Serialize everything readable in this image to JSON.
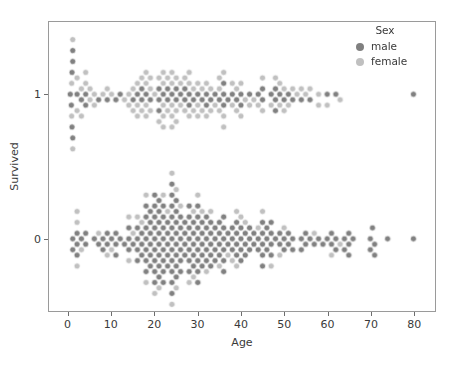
{
  "chart_data": {
    "type": "scatter",
    "plot_style": "swarmplot",
    "title": "",
    "xlabel": "Age",
    "ylabel": "Survived",
    "xlim": [
      -4.5,
      85
    ],
    "ylim": [
      -0.5,
      1.5
    ],
    "grid": false,
    "xticks": [
      0,
      10,
      20,
      30,
      40,
      50,
      60,
      70,
      80
    ],
    "xticklabels": [
      "0",
      "10",
      "20",
      "30",
      "40",
      "50",
      "60",
      "70",
      "80"
    ],
    "yticks": [
      0,
      1
    ],
    "yticklabels": [
      "0",
      "1"
    ],
    "legend": {
      "title": "Sex",
      "position": "upper right",
      "entries": [
        {
          "label": "male",
          "color": "#808080"
        },
        {
          "label": "female",
          "color": "#c0c0c0"
        }
      ]
    },
    "categories": [
      "0",
      "1"
    ],
    "series": [
      {
        "name": "male",
        "color": "#808080",
        "marker": "o",
        "points_survived_0": [
          1,
          1,
          2,
          2,
          2,
          3,
          4,
          4,
          6,
          7,
          8,
          8,
          9,
          9,
          10,
          11,
          11,
          11,
          12,
          13,
          14,
          14,
          14,
          15,
          16,
          16,
          16,
          16,
          17,
          17,
          17,
          18,
          18,
          18,
          18,
          18,
          18,
          18,
          19,
          19,
          19,
          19,
          19,
          19,
          20,
          20,
          20,
          20,
          20,
          20,
          20,
          20,
          20,
          21,
          21,
          21,
          21,
          21,
          21,
          21,
          21,
          22,
          22,
          22,
          22,
          22,
          22,
          22,
          22,
          23,
          23,
          23,
          23,
          23,
          24,
          24,
          24,
          24,
          24,
          24,
          24,
          24,
          24,
          24,
          24,
          25,
          25,
          25,
          25,
          25,
          25,
          25,
          25,
          26,
          26,
          26,
          26,
          26,
          26,
          27,
          27,
          27,
          27,
          28,
          28,
          28,
          28,
          28,
          28,
          28,
          29,
          29,
          29,
          29,
          29,
          30,
          30,
          30,
          30,
          30,
          30,
          30,
          30,
          31,
          31,
          31,
          31,
          31,
          32,
          32,
          32,
          32,
          32,
          33,
          33,
          33,
          33,
          33,
          34,
          34,
          34,
          34,
          35,
          35,
          35,
          35,
          36,
          36,
          36,
          36,
          36,
          36,
          37,
          37,
          38,
          38,
          38,
          39,
          39,
          39,
          39,
          40,
          40,
          40,
          40,
          41,
          41,
          41,
          42,
          42,
          42,
          43,
          43,
          44,
          44,
          45,
          45,
          45,
          45,
          45,
          46,
          46,
          46,
          47,
          47,
          47,
          47,
          48,
          49,
          49,
          50,
          50,
          51,
          51,
          52,
          52,
          54,
          54,
          55,
          55,
          56,
          57,
          58,
          59,
          60,
          61,
          61,
          62,
          62,
          64,
          64,
          65,
          65,
          65,
          66,
          70,
          70,
          70.5,
          71,
          71,
          74,
          80
        ],
        "points_survived_1": [
          0.42,
          0.67,
          0.83,
          0.83,
          1,
          1,
          1,
          2,
          3,
          4,
          4,
          7,
          9,
          11,
          12,
          15,
          16,
          17,
          17,
          18,
          19,
          21,
          21,
          21,
          22,
          23,
          23,
          24,
          25,
          25,
          26,
          27,
          27,
          28,
          28,
          29,
          30,
          31,
          32,
          32,
          33,
          34,
          35,
          36,
          36,
          36,
          37,
          38,
          39,
          40,
          40,
          42,
          44,
          45,
          45,
          47,
          48,
          48,
          48,
          49,
          50,
          51,
          52,
          54,
          56,
          60,
          62,
          80
        ]
      },
      {
        "name": "female",
        "color": "#c0c0c0",
        "marker": "o",
        "points_survived_0": [
          2,
          2,
          2,
          3,
          7,
          9,
          10,
          14,
          14,
          15,
          16,
          17,
          18,
          18,
          20,
          21,
          22,
          23,
          24,
          24,
          25,
          25,
          26,
          28,
          29,
          29,
          30,
          31,
          32,
          33,
          35,
          37,
          38,
          39,
          39,
          40,
          41,
          44,
          45,
          47,
          49,
          50,
          57,
          61,
          63
        ],
        "points_survived_1": [
          0.75,
          0.75,
          1,
          1,
          2,
          2,
          3,
          3,
          4,
          4,
          5,
          5,
          6,
          6,
          8,
          9,
          10,
          13,
          14,
          14,
          15,
          15,
          16,
          16,
          16,
          17,
          17,
          18,
          18,
          18,
          18,
          19,
          19,
          19,
          20,
          21,
          21,
          22,
          22,
          22,
          22,
          22,
          23,
          23,
          24,
          24,
          24,
          24,
          24,
          25,
          25,
          25,
          26,
          26,
          27,
          27,
          28,
          28,
          28,
          29,
          29,
          30,
          30,
          30,
          31,
          31,
          32,
          32,
          33,
          33,
          34,
          35,
          35,
          35,
          36,
          36,
          36,
          38,
          38,
          39,
          39,
          40,
          40,
          41,
          42,
          43,
          44,
          45,
          45,
          47,
          48,
          49,
          49,
          50,
          50,
          51,
          52,
          53,
          54,
          55,
          56,
          58,
          58,
          60,
          63
        ]
      }
    ]
  },
  "colors": {
    "male": "#808080",
    "female": "#c0c0c0",
    "axis": "#9a9a9a",
    "text": "#3a3a3a",
    "background": "#ffffff"
  }
}
